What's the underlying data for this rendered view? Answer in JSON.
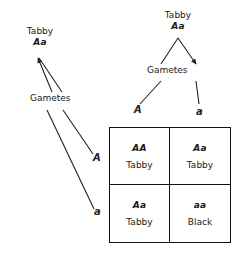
{
  "diagram": {
    "ink_color": "#222222",
    "background_color": "#ffffff"
  },
  "parents": {
    "top": {
      "phenotype": "Tabby",
      "genotype": "Aa",
      "gametes_label": "Gametes",
      "gametes": [
        {
          "allele": "A"
        },
        {
          "allele": "a"
        }
      ]
    },
    "left": {
      "phenotype": "Tabby",
      "genotype": "Aa",
      "gametes_label": "Gametes",
      "gametes": [
        {
          "allele": "A"
        },
        {
          "allele": "a"
        }
      ]
    }
  },
  "punnett": {
    "cells": [
      {
        "genotype": "AA",
        "phenotype": "Tabby"
      },
      {
        "genotype": "Aa",
        "phenotype": "Tabby"
      },
      {
        "genotype": "Aa",
        "phenotype": "Tabby"
      },
      {
        "genotype": "aa",
        "phenotype": "Black"
      }
    ]
  }
}
